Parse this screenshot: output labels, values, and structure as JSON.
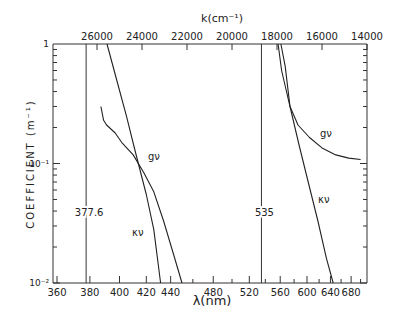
{
  "chart_data": {
    "type": "line",
    "title": "",
    "xlabel": "λ(nm)",
    "x2label": "k(cm⁻¹)",
    "ylabel": "COEFFICIENT  (m⁻¹)",
    "yscale": "log",
    "ylim": [
      0.01,
      1
    ],
    "xlim_nm": [
      357.7,
      700
    ],
    "x2lim_cm": [
      27956,
      14000
    ],
    "grid": false,
    "x_ticks_nm": [
      360,
      380,
      400,
      420,
      440,
      480,
      520,
      560,
      600,
      640,
      680
    ],
    "x_minor_ticks_nm": [
      460,
      500,
      540,
      580,
      620,
      660,
      700
    ],
    "x2_ticks_cm": [
      26000,
      24000,
      22000,
      20000,
      18000,
      16000,
      14000
    ],
    "y_ticks": [
      {
        "value": 1,
        "label": "1"
      },
      {
        "value": 0.1,
        "label": "10⁻¹"
      },
      {
        "value": 0.01,
        "label": "10⁻²"
      }
    ],
    "vertical_markers": [
      {
        "x_nm": 377.6,
        "label": "377.6"
      },
      {
        "x_nm": 535,
        "label": "535"
      }
    ],
    "series": [
      {
        "name": "κν (band 1)",
        "label": "κν",
        "points": [
          [
            391.3,
            1.0
          ],
          [
            398,
            0.5
          ],
          [
            405,
            0.25
          ],
          [
            412,
            0.12
          ],
          [
            420,
            0.055
          ],
          [
            426,
            0.028
          ],
          [
            431.5,
            0.01
          ]
        ]
      },
      {
        "name": "gν (band 1)",
        "label": "gν",
        "points": [
          [
            387.2,
            0.3
          ],
          [
            389,
            0.23
          ],
          [
            391,
            0.21
          ],
          [
            397,
            0.18
          ],
          [
            402,
            0.148
          ],
          [
            410,
            0.118
          ],
          [
            418,
            0.084
          ],
          [
            426,
            0.058
          ],
          [
            434,
            0.033
          ],
          [
            442,
            0.018
          ],
          [
            450,
            0.01
          ]
        ]
      },
      {
        "name": "κν (band 2)",
        "label": "κν",
        "points": [
          [
            561,
            1.0
          ],
          [
            567,
            0.65
          ],
          [
            574,
            0.3
          ],
          [
            588,
            0.14
          ],
          [
            602,
            0.07
          ],
          [
            618,
            0.033
          ],
          [
            633,
            0.016
          ],
          [
            645,
            0.01
          ]
        ]
      },
      {
        "name": "gν (band 2)",
        "label": "gν",
        "points": [
          [
            557,
            1.0
          ],
          [
            562,
            0.6
          ],
          [
            568,
            0.42
          ],
          [
            574,
            0.3
          ],
          [
            586,
            0.21
          ],
          [
            604,
            0.165
          ],
          [
            625,
            0.135
          ],
          [
            650,
            0.118
          ],
          [
            675,
            0.111
          ],
          [
            700,
            0.108
          ]
        ]
      }
    ]
  },
  "labels": {
    "marker_1": "377.6",
    "marker_2": "535",
    "g_left": "gν",
    "k_left": "κν",
    "g_right": "gν",
    "k_right": "κν"
  }
}
